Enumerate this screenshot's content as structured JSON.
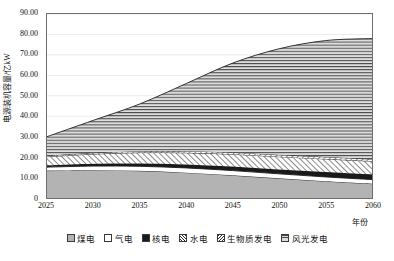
{
  "chart_data": {
    "type": "area",
    "title": "",
    "xlabel": "年份",
    "ylabel": "电源装机容量/亿kW",
    "xlim": [
      2025,
      2060
    ],
    "ylim": [
      0,
      90
    ],
    "ytick_step": 10,
    "xtick_step": 5,
    "grid": true,
    "stacked": true,
    "legend_position": "bottom",
    "x": [
      2025,
      2030,
      2035,
      2040,
      2045,
      2050,
      2055,
      2060
    ],
    "xticklabels": [
      "2025",
      "2030",
      "2035",
      "2040",
      "2045",
      "2050",
      "2055",
      "2060"
    ],
    "yticklabels": [
      "0",
      "10.00",
      "20.00",
      "30.00",
      "40.00",
      "50.00",
      "60.00",
      "70.00",
      "80.00",
      "90.00"
    ],
    "series": [
      {
        "name": "煤电",
        "fill": "#b3b3b3",
        "pattern": "solid",
        "values": [
          13.4,
          13.6,
          13.3,
          12.4,
          11.1,
          9.6,
          8.2,
          7.0
        ]
      },
      {
        "name": "气电",
        "fill": "#ffffff",
        "pattern": "solid",
        "values": [
          1.7,
          2.0,
          2.2,
          2.3,
          2.3,
          2.2,
          2.1,
          2.0
        ]
      },
      {
        "name": "核电",
        "fill": "#1a1a1a",
        "pattern": "solid",
        "values": [
          0.8,
          1.1,
          1.4,
          1.7,
          2.0,
          2.2,
          2.4,
          2.5
        ]
      },
      {
        "name": "水电",
        "fill": "#ffffff",
        "pattern": "diagonal-forward",
        "values": [
          4.3,
          4.8,
          5.3,
          5.7,
          6.0,
          6.2,
          6.4,
          6.5
        ]
      },
      {
        "name": "生物质发电",
        "fill": "#ffffff",
        "pattern": "diagonal-backward",
        "values": [
          0.5,
          0.6,
          0.7,
          0.8,
          0.9,
          0.9,
          1.0,
          1.0
        ]
      },
      {
        "name": "风光发电",
        "fill": "#d8d8d8",
        "pattern": "horizontal-lines",
        "values": [
          9.3,
          15.9,
          23.1,
          33.1,
          43.7,
          51.9,
          56.9,
          59.0
        ]
      }
    ],
    "totals": [
      30.0,
      38.0,
      46.0,
      56.0,
      66.0,
      73.0,
      77.0,
      78.0
    ]
  }
}
